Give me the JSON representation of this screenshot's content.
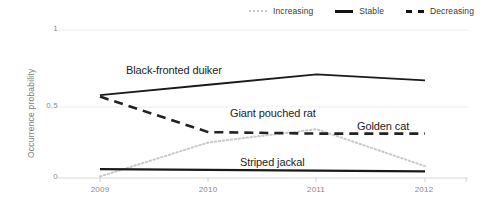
{
  "chart_data": {
    "type": "line",
    "title": "",
    "xlabel": "",
    "ylabel": "Occurrence probability",
    "x": [
      2009,
      2010,
      2011,
      2012
    ],
    "xtick_labels": [
      "2009",
      "2010",
      "2011",
      "2012"
    ],
    "ytick_labels": [
      "0",
      "0.5",
      "1"
    ],
    "ytick_values": [
      0,
      0.5,
      1
    ],
    "ylim": [
      0,
      1
    ],
    "xlim": [
      2009,
      2012
    ],
    "grid": "horizontal",
    "legend_position": "top-right",
    "legend": [
      {
        "label": "Increasing",
        "style": "dotted",
        "color": "#c7c7c7"
      },
      {
        "label": "Stable",
        "style": "solid",
        "color": "#141414"
      },
      {
        "label": "Decreasing",
        "style": "dashed",
        "color": "#141414"
      }
    ],
    "series": [
      {
        "name": "Black-fronted duiker",
        "trend": "Stable",
        "style": "solid",
        "color": "#1a1a1a",
        "values": [
          0.56,
          0.63,
          0.7,
          0.66
        ]
      },
      {
        "name": "Giant pouched rat",
        "trend": "Decreasing",
        "style": "dashed",
        "color": "#222222",
        "values": [
          0.55,
          0.31,
          0.3,
          0.3
        ]
      },
      {
        "name": "Golden cat",
        "trend": "Increasing",
        "style": "dotted",
        "color": "#c9c9c9",
        "values": [
          0.01,
          0.24,
          0.33,
          0.08
        ]
      },
      {
        "name": "Striped jackal",
        "trend": "Stable",
        "style": "solid",
        "color": "#1a1a1a",
        "values": [
          0.06,
          0.055,
          0.05,
          0.045
        ]
      }
    ],
    "annotations": [
      {
        "text": "Black-fronted duiker",
        "series": "Black-fronted duiker"
      },
      {
        "text": "Giant pouched rat",
        "series": "Giant pouched rat"
      },
      {
        "text": "Golden cat",
        "series": "Golden cat"
      },
      {
        "text": "Striped jackal",
        "series": "Striped jackal"
      }
    ]
  }
}
